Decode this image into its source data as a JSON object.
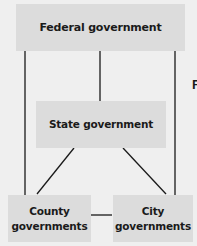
{
  "diagram": {
    "type": "hierarchy",
    "nodes": [
      {
        "id": "federal",
        "label": "Federal government"
      },
      {
        "id": "state",
        "label": "State government"
      },
      {
        "id": "county",
        "label": "County\ngovernments"
      },
      {
        "id": "city",
        "label": "City\ngovernments"
      }
    ],
    "edges": [
      {
        "from": "federal",
        "to": "state"
      },
      {
        "from": "federal",
        "to": "county"
      },
      {
        "from": "federal",
        "to": "city"
      },
      {
        "from": "state",
        "to": "county"
      },
      {
        "from": "state",
        "to": "city"
      },
      {
        "from": "county",
        "to": "city"
      }
    ],
    "cut_off_text": "F",
    "colors": {
      "background": "#efefef",
      "box_fill": "#dcdcdc",
      "line": "#1a1a1a",
      "text": "#1a1a1a"
    }
  }
}
